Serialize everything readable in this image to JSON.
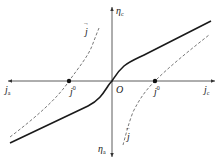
{
  "diagram": {
    "type": "polarization-curve",
    "axes": {
      "horizontal": {
        "left_label": "j",
        "left_subscript": "a",
        "right_label": "j",
        "right_subscript": "c"
      },
      "vertical": {
        "top_label": "η",
        "top_subscript": "c",
        "bottom_label": "η",
        "bottom_subscript": "a"
      },
      "origin_label": "O"
    },
    "curves": [
      {
        "name": "overall-polarization-curve",
        "style": "solid"
      },
      {
        "name": "anodic-partial-curve",
        "style": "dashed",
        "label": "j",
        "label_accent": "→"
      },
      {
        "name": "cathodic-partial-curve",
        "style": "dashed",
        "label": "j",
        "label_accent": "←"
      }
    ],
    "points": [
      {
        "name": "exchange-current-anodic",
        "label": "j",
        "superscript": "0"
      },
      {
        "name": "exchange-current-cathodic",
        "label": "j",
        "superscript": "0"
      }
    ],
    "colors": {
      "axis": "#333333",
      "solid_curve": "#1a1a1a",
      "dashed_curve": "#555555",
      "background": "#ffffff"
    }
  }
}
